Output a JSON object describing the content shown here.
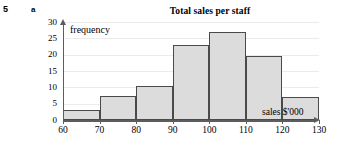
{
  "exercise": {
    "number": "5",
    "part": "a"
  },
  "chart_data": {
    "type": "bar",
    "title": "Total sales per staff",
    "xlabel": "sales $'000",
    "ylabel": "frequency",
    "categories": [
      "60 - 70",
      "70 - 80",
      "80 - 90",
      "90 - 100",
      "100 - 110",
      "110 - 120",
      "120 - 130"
    ],
    "bin_edges": [
      60,
      70,
      80,
      90,
      100,
      110,
      120,
      130
    ],
    "values": [
      3,
      7.5,
      10.5,
      23,
      27,
      19.5,
      7
    ],
    "xlim": [
      60,
      130
    ],
    "ylim": [
      0,
      30
    ],
    "x_ticks": [
      "60",
      "70",
      "80",
      "90",
      "100",
      "110",
      "120",
      "130"
    ],
    "y_ticks": [
      "0",
      "5",
      "10",
      "15",
      "20",
      "25",
      "30"
    ],
    "grid": true,
    "legend": false,
    "bar_fill_color": "#dcdcdc",
    "bar_border_color": "#4a4a4a",
    "axis_color": "#5d5d5d",
    "gridline_color": "#eceaea"
  }
}
